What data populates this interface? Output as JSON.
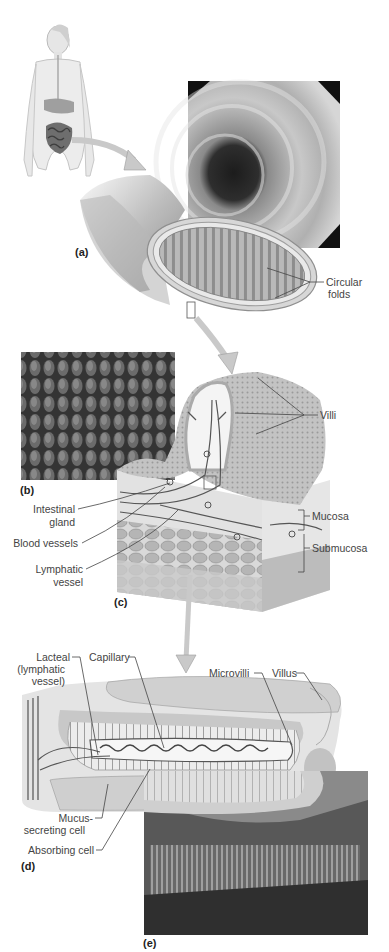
{
  "figure": {
    "panels": [
      {
        "id": "a",
        "label": "(a)",
        "content": "Small intestine section with endoscopic view",
        "callouts": [
          "Circular folds"
        ]
      },
      {
        "id": "b",
        "label": "(b)",
        "content": "Micrograph of villi"
      },
      {
        "id": "c",
        "label": "(c)",
        "content": "Villi cross-section",
        "callouts": [
          "Villi",
          "Intestinal gland",
          "Blood vessels",
          "Lymphatic vessel",
          "Mucosa",
          "Submucosa"
        ]
      },
      {
        "id": "d",
        "label": "(d)",
        "content": "Single villus detail",
        "callouts": [
          "Lacteal (lymphatic vessel)",
          "Capillary",
          "Microvilli",
          "Villus",
          "Mucus-secreting cell",
          "Absorbing cell"
        ]
      },
      {
        "id": "e",
        "label": "(e)",
        "content": "Micrograph of microvilli"
      }
    ]
  },
  "labels": {
    "panel_a": "(a)",
    "panel_b": "(b)",
    "panel_c": "(c)",
    "panel_d": "(d)",
    "panel_e": "(e)",
    "circular_1": "Circular",
    "circular_2": "folds",
    "villi": "Villi",
    "intestinal_1": "Intestinal",
    "intestinal_2": "gland",
    "blood_vessels": "Blood vessels",
    "lymphatic_1": "Lymphatic",
    "lymphatic_2": "vessel",
    "mucosa": "Mucosa",
    "submucosa": "Submucosa",
    "lacteal_1": "Lacteal",
    "lacteal_2": "(lymphatic",
    "lacteal_3": "vessel)",
    "capillary": "Capillary",
    "microvilli": "Microvilli",
    "villus": "Villus",
    "mucus_1": "Mucus-",
    "mucus_2": "secreting cell",
    "absorbing": "Absorbing cell"
  },
  "colors": {
    "line": "#444444",
    "arrow": "#b8b8b8",
    "tissue": "#cfcfcf",
    "photo_dark": "#3a3a3a"
  }
}
